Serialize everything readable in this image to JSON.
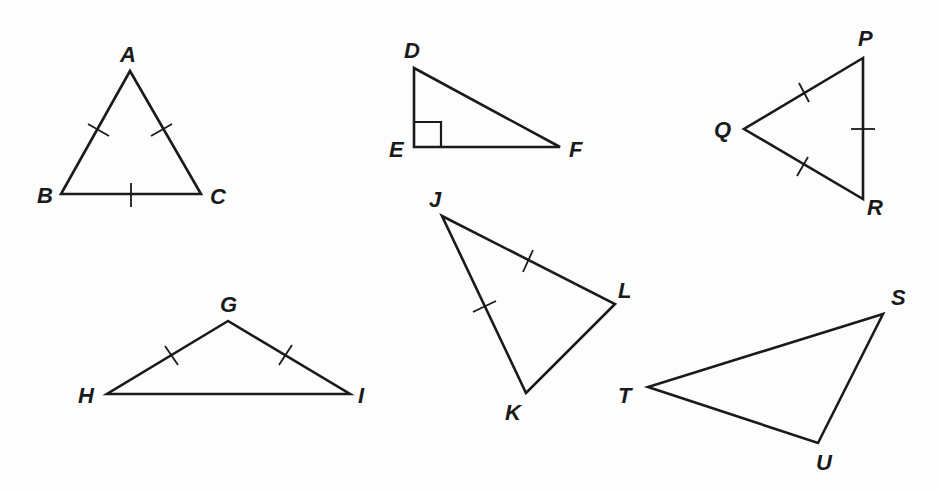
{
  "figure": {
    "stroke_color": "#1a1a1a",
    "background_color": "#fdfdfd"
  },
  "triangles": [
    {
      "name": "ABC",
      "vertices": {
        "A": [
          130,
          71
        ],
        "B": [
          61,
          194
        ],
        "C": [
          201,
          194
        ]
      },
      "labels": [
        {
          "text": "A",
          "x": 120,
          "y": 62
        },
        {
          "text": "B",
          "x": 37,
          "y": 203
        },
        {
          "text": "C",
          "x": 210,
          "y": 204
        }
      ],
      "tick_marks": [
        "AB",
        "AC",
        "BC"
      ],
      "markers": []
    },
    {
      "name": "DEF",
      "vertices": {
        "D": [
          414,
          68
        ],
        "E": [
          414,
          147
        ],
        "F": [
          560,
          147
        ]
      },
      "labels": [
        {
          "text": "D",
          "x": 404,
          "y": 58
        },
        {
          "text": "E",
          "x": 389,
          "y": 157
        },
        {
          "text": "F",
          "x": 569,
          "y": 157
        }
      ],
      "tick_marks": [],
      "markers": [
        "right-angle at E"
      ]
    },
    {
      "name": "PQR",
      "vertices": {
        "P": [
          863,
          58
        ],
        "Q": [
          744,
          129
        ],
        "R": [
          863,
          199
        ]
      },
      "labels": [
        {
          "text": "P",
          "x": 858,
          "y": 46
        },
        {
          "text": "Q",
          "x": 714,
          "y": 137
        },
        {
          "text": "R",
          "x": 867,
          "y": 215
        }
      ],
      "tick_marks": [
        "PQ",
        "QR",
        "PR"
      ],
      "markers": []
    },
    {
      "name": "GHI",
      "vertices": {
        "G": [
          228,
          321
        ],
        "H": [
          107,
          394
        ],
        "I": [
          350,
          394
        ]
      },
      "labels": [
        {
          "text": "G",
          "x": 220,
          "y": 312
        },
        {
          "text": "H",
          "x": 78,
          "y": 403
        },
        {
          "text": "I",
          "x": 358,
          "y": 403
        }
      ],
      "tick_marks": [
        "GH",
        "GI"
      ],
      "markers": []
    },
    {
      "name": "JKL",
      "vertices": {
        "J": [
          442,
          216
        ],
        "K": [
          526,
          393
        ],
        "L": [
          615,
          304
        ]
      },
      "labels": [
        {
          "text": "J",
          "x": 429,
          "y": 207
        },
        {
          "text": "K",
          "x": 505,
          "y": 420
        },
        {
          "text": "L",
          "x": 618,
          "y": 298
        }
      ],
      "tick_marks": [
        "JL",
        "JK"
      ],
      "markers": []
    },
    {
      "name": "STU",
      "vertices": {
        "S": [
          883,
          314
        ],
        "T": [
          648,
          387
        ],
        "U": [
          818,
          443
        ]
      },
      "labels": [
        {
          "text": "S",
          "x": 891,
          "y": 305
        },
        {
          "text": "T",
          "x": 618,
          "y": 403
        },
        {
          "text": "U",
          "x": 816,
          "y": 470
        }
      ],
      "tick_marks": [],
      "markers": []
    }
  ]
}
